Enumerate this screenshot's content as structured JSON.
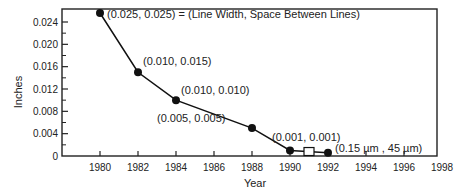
{
  "chart_data": {
    "type": "line",
    "title": "",
    "xlabel": "Year",
    "ylabel": "Inches",
    "xlim": [
      1978,
      1998
    ],
    "ylim": [
      0,
      0.026
    ],
    "x_ticks": [
      "1980",
      "1982",
      "1984",
      "1986",
      "1988",
      "1990",
      "1992",
      "1994",
      "1996",
      "1998"
    ],
    "y_ticks": [
      "0",
      "0.004",
      "0.008",
      "0.012",
      "0.016",
      "0.020",
      "0.024"
    ],
    "grid": false,
    "series": [
      {
        "name": "Line Width / Space Between Lines",
        "x": [
          1980,
          1982,
          1984,
          1988,
          1990,
          1992
        ],
        "y": [
          0.025,
          0.015,
          0.01,
          0.005,
          0.001,
          0.0006
        ],
        "marker": "filled-circle"
      }
    ],
    "special_markers": [
      {
        "x": 1991,
        "y": 0.0008,
        "marker": "open-square"
      }
    ],
    "annotations": [
      {
        "x": 1980,
        "text": "(0.025, 0.025) = (Line Width, Space Between Lines)"
      },
      {
        "x": 1982,
        "text": "(0.010, 0.015)"
      },
      {
        "x": 1984,
        "text": "(0.010, 0.010)"
      },
      {
        "x": 1988,
        "text": "(0.005, 0.005)"
      },
      {
        "x": 1990,
        "text": "(0.001, 0.001)"
      },
      {
        "x": 1992,
        "text": "(0.15 µm , 45 µm)"
      }
    ]
  }
}
